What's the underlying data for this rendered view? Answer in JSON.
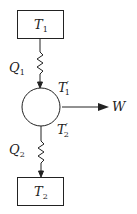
{
  "diagram": {
    "hot_reservoir": {
      "symbol": "T",
      "sub": "1"
    },
    "cold_reservoir": {
      "symbol": "T",
      "sub": "2"
    },
    "heat_in": {
      "symbol": "Q",
      "sub": "1"
    },
    "heat_out": {
      "symbol": "Q",
      "sub": "2"
    },
    "engine_temp_hot": {
      "symbol": "T",
      "sub": "1",
      "prime": "′"
    },
    "engine_temp_cold": {
      "symbol": "T",
      "sub": "2",
      "prime": "′"
    },
    "work": {
      "symbol": "W"
    },
    "line_color": "#222222"
  }
}
